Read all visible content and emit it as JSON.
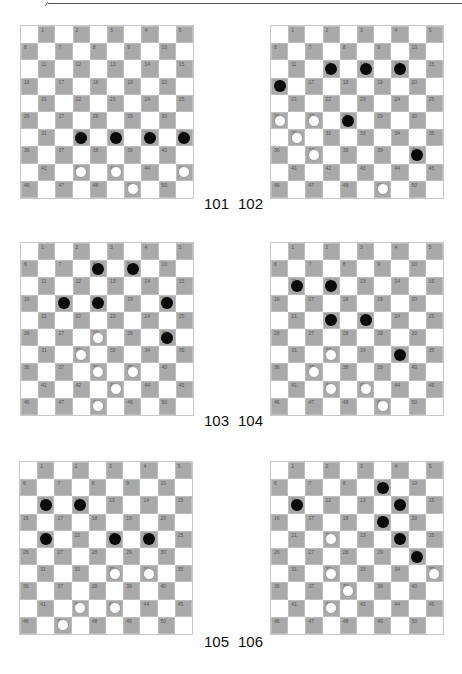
{
  "colors": {
    "dark_square": "#a9a9a9",
    "light_square": "#ffffff",
    "black_piece": "#0a0a0a",
    "white_piece": "#ffffff"
  },
  "boards": [
    {
      "id": "101",
      "label": "101",
      "left": 20,
      "top": 25,
      "label_left": 204,
      "label_top": 196,
      "black": [
        32,
        33,
        34,
        35
      ],
      "white": [
        42,
        43,
        45,
        49
      ]
    },
    {
      "id": "102",
      "label": "102",
      "left": 270,
      "top": 25,
      "label_left": 238,
      "label_top": 196,
      "black": [
        12,
        13,
        14,
        16,
        28,
        40
      ],
      "white": [
        26,
        27,
        31,
        37,
        49
      ]
    },
    {
      "id": "103",
      "label": "103",
      "left": 20,
      "top": 242,
      "label_left": 204,
      "label_top": 413,
      "black": [
        8,
        9,
        17,
        18,
        20,
        30
      ],
      "white": [
        28,
        32,
        38,
        39,
        43,
        48
      ]
    },
    {
      "id": "104",
      "label": "104",
      "left": 270,
      "top": 242,
      "label_left": 238,
      "label_top": 413,
      "black": [
        11,
        12,
        22,
        23,
        34
      ],
      "white": [
        32,
        37,
        42,
        43,
        49
      ]
    },
    {
      "id": "105",
      "label": "105",
      "left": 19,
      "top": 461,
      "label_left": 204,
      "label_top": 634,
      "black": [
        11,
        12,
        21,
        23,
        24
      ],
      "white": [
        33,
        34,
        42,
        43,
        47
      ]
    },
    {
      "id": "106",
      "label": "106",
      "left": 270,
      "top": 461,
      "label_left": 238,
      "label_top": 634,
      "black": [
        9,
        11,
        14,
        19,
        24,
        30
      ],
      "white": [
        22,
        32,
        35,
        38,
        42
      ]
    }
  ]
}
